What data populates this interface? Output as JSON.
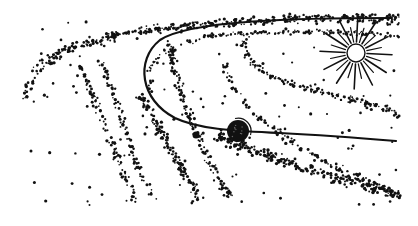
{
  "illustration": {
    "subject": "Stippled drawing of a comet/planet crossing the Sun's orbit through meteor streams",
    "colors": {
      "ink": "#111111",
      "background": "#ffffff"
    },
    "sun": {
      "cx": 356,
      "cy": 53,
      "r": 9,
      "rays": 24,
      "ray_inner": 11,
      "ray_outer_long": 36,
      "ray_outer_short": 26
    },
    "planet": {
      "cx": 238,
      "cy": 131,
      "r": 11
    },
    "moon": {
      "cx": 196,
      "cy": 135,
      "r": 3.5
    },
    "orbit": {
      "path": "M 392 18 C 300 18, 190 20, 160 40 C 135 60, 140 100, 175 118 C 200 130, 240 131, 280 133 C 320 135, 360 138, 396 141",
      "width": 2.2
    },
    "streams": [
      {
        "path": "M 25 100 C 30 60, 80 40, 150 30 C 230 20, 330 14, 400 16",
        "count": 260,
        "spread": 6,
        "size": 1.3
      },
      {
        "path": "M 30 70 C 60 40, 140 30, 220 24 C 300 18, 360 20, 400 22",
        "count": 180,
        "spread": 5,
        "size": 1.2
      },
      {
        "path": "M 150 90 C 140 60, 170 40, 230 34 C 300 30, 360 32, 400 36",
        "count": 160,
        "spread": 4,
        "size": 1.1
      },
      {
        "path": "M 250 34 C 230 50, 260 80, 320 92 C 360 100, 390 110, 400 116",
        "count": 160,
        "spread": 5,
        "size": 1.2
      },
      {
        "path": "M 80 65 C 95 100, 110 140, 135 200",
        "count": 90,
        "spread": 5,
        "size": 1.3
      },
      {
        "path": "M 100 60 C 120 100, 125 150, 155 200",
        "count": 90,
        "spread": 5,
        "size": 1.3
      },
      {
        "path": "M 140 95 C 160 130, 180 165, 200 200",
        "count": 140,
        "spread": 6,
        "size": 1.3
      },
      {
        "path": "M 170 40 C 175 90, 200 150, 230 198",
        "count": 150,
        "spread": 6,
        "size": 1.3
      },
      {
        "path": "M 215 135 C 250 150, 300 170, 400 195",
        "count": 230,
        "spread": 8,
        "size": 1.4
      },
      {
        "path": "M 225 60 C 230 100, 270 130, 320 160 C 360 178, 390 190, 400 198",
        "count": 120,
        "spread": 6,
        "size": 1.3
      }
    ],
    "scatter": {
      "count": 140,
      "x": [
        22,
        400
      ],
      "y": [
        20,
        205
      ],
      "size": [
        1.2,
        2.4
      ]
    },
    "bounds": {
      "x": [
        22,
        402
      ],
      "y": [
        14,
        206
      ]
    }
  }
}
